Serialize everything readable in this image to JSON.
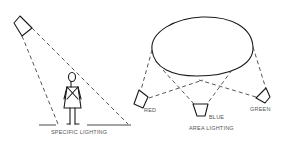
{
  "diagram": {
    "left_panel": {
      "caption": "SPECIFIC LIGHTING",
      "elements": [
        "spotlight",
        "female-figure",
        "light-cone",
        "floor-line"
      ]
    },
    "right_panel": {
      "caption": "AREA LIGHTING",
      "lights": [
        {
          "label": "RED"
        },
        {
          "label": "BLUE"
        },
        {
          "label": "GREEN"
        }
      ],
      "elements": [
        "lit-area-ellipse",
        "overlapping-light-beams"
      ]
    },
    "colors": {
      "ink": "#1a1a1a",
      "label": "#555555",
      "background": "#ffffff"
    }
  }
}
